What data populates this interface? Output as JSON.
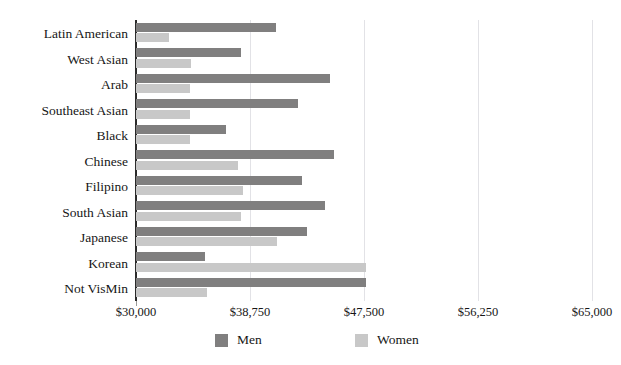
{
  "chart_data": {
    "type": "bar",
    "orientation": "horizontal",
    "title": "",
    "xlabel": "",
    "ylabel": "",
    "xlim": [
      30000,
      65000
    ],
    "grid": true,
    "legend_position": "bottom",
    "xticks": [
      "$30,000",
      "$38,750",
      "$47,500",
      "$56,250",
      "$65,000"
    ],
    "xtick_values": [
      30000,
      38750,
      47500,
      56250,
      65000
    ],
    "categories": [
      "Latin American",
      "West Asian",
      "Arab",
      "Southeast Asian",
      "Black",
      "Chinese",
      "Filipino",
      "South Asian",
      "Japanese",
      "Korean",
      "Not VisMin"
    ],
    "series": [
      {
        "name": "Men",
        "color": "#807f7f",
        "values": [
          40750,
          38050,
          44900,
          42450,
          36900,
          45200,
          42750,
          44500,
          43100,
          35300,
          47650
        ]
      },
      {
        "name": "Women",
        "color": "#c8c8c8",
        "values": [
          32550,
          34250,
          34150,
          34150,
          34150,
          37800,
          38200,
          38050,
          40850,
          47650,
          35450
        ]
      }
    ]
  },
  "legend": {
    "men_label": "Men",
    "women_label": "Women",
    "men_color": "#807f7f",
    "women_color": "#c8c8c8"
  }
}
